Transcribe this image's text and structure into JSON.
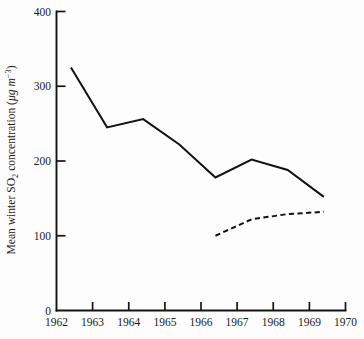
{
  "chart_data": {
    "type": "line",
    "title": "",
    "xlabel": "",
    "ylabel": "Mean winter SO2 concentration (µg m−3)",
    "ylabel_parts": {
      "lead": "Mean winter SO",
      "sub": "2",
      "mid": " concentration (",
      "unit_mu": "μg m",
      "sup": "−3",
      "tail": ")"
    },
    "x": [
      1962.4,
      1963.4,
      1964.4,
      1965.4,
      1966.4,
      1967.4,
      1968.4,
      1969.4
    ],
    "xlim": [
      1962,
      1970
    ],
    "ylim": [
      0,
      400
    ],
    "grid": false,
    "legend": "none",
    "xticks": [
      1962,
      1963,
      1964,
      1965,
      1966,
      1967,
      1968,
      1969,
      1970
    ],
    "xticklabels": [
      "1962",
      "1963",
      "1964",
      "1965",
      "1966",
      "1967",
      "1968",
      "1969",
      "1970"
    ],
    "yticks": [
      0,
      100,
      200,
      300,
      400
    ],
    "yticklabels": [
      "0",
      "100",
      "200",
      "300",
      "400"
    ],
    "series": [
      {
        "name": "solid-series",
        "style": "solid",
        "x": [
          1962.4,
          1963.4,
          1964.4,
          1965.4,
          1966.4,
          1967.4,
          1968.4,
          1969.4
        ],
        "values": [
          325,
          245,
          256,
          222,
          178,
          202,
          188,
          152
        ]
      },
      {
        "name": "dashed-series",
        "style": "dashed",
        "x": [
          1966.4,
          1967.4,
          1968.4,
          1969.4
        ],
        "values": [
          100,
          122,
          129,
          132
        ]
      }
    ]
  },
  "axes": {
    "y_axis_name": "y-axis",
    "x_axis_name": "x-axis"
  }
}
